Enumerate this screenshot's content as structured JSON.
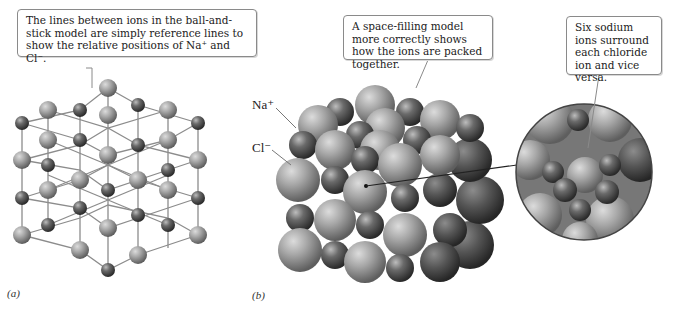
{
  "panel_a": {
    "label": "(a)",
    "callout": "The lines between ions in the ball-and-stick model are simply reference lines to show the relative positions of Na⁺ and Cl⁻.",
    "model": "ball-and-stick"
  },
  "panel_b": {
    "label": "(b)",
    "callout": "A space-filling model more correctly shows how the ions are packed together.",
    "model": "space-filling",
    "ion_labels": {
      "sodium": "Na⁺",
      "chloride": "Cl⁻"
    },
    "zoom_callout": "Six sodium ions surround each chloride ion and vice versa."
  },
  "colors": {
    "na_ion": "#555555",
    "cl_ion": "#a0a0a0",
    "stick": "#8c8c8c",
    "callout_border": "#8a8a8a"
  }
}
